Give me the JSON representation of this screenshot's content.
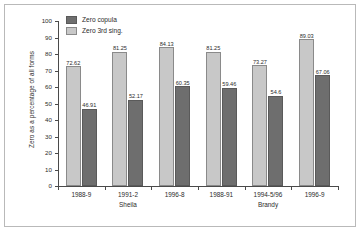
{
  "chart_data": {
    "type": "bar",
    "title": "",
    "xlabel": "",
    "ylabel": "Zero as a percentage of all forms",
    "ylim": [
      0,
      100
    ],
    "ytick_step": 10,
    "yticks": [
      "100",
      "90",
      "80",
      "70",
      "60",
      "50",
      "40",
      "30",
      "20",
      "10",
      "0"
    ],
    "grid": false,
    "legend_position": "top-left",
    "categories": [
      "1988-9",
      "1991-2",
      "1996-8",
      "1988-91",
      "1994-5/96",
      "1996-9"
    ],
    "group_labels": [
      {
        "label": "Sheila",
        "categories": [
          "1988-9",
          "1991-2",
          "1996-8"
        ]
      },
      {
        "label": "Brandy",
        "categories": [
          "1988-91",
          "1994-5/96",
          "1996-9"
        ]
      }
    ],
    "series": [
      {
        "name": "Zero 3rd sing.",
        "color": "#c8c8c8",
        "values": [
          72.62,
          81.25,
          84.13,
          81.25,
          73.27,
          89.03
        ],
        "labels": [
          "72.62",
          "81.25",
          "84.13",
          "81.25",
          "73.27",
          "89.03"
        ]
      },
      {
        "name": "Zero copula",
        "color": "#6e6e6e",
        "values": [
          46.91,
          52.17,
          60.35,
          59.46,
          54.6,
          67.06
        ],
        "labels": [
          "46.91",
          "52.17",
          "60.35",
          "59.46",
          "54.6",
          "67.06"
        ]
      }
    ]
  },
  "legend": {
    "items": [
      {
        "label": "Zero copula",
        "color": "#6e6e6e"
      },
      {
        "label": "Zero 3rd sing.",
        "color": "#c8c8c8"
      }
    ]
  }
}
